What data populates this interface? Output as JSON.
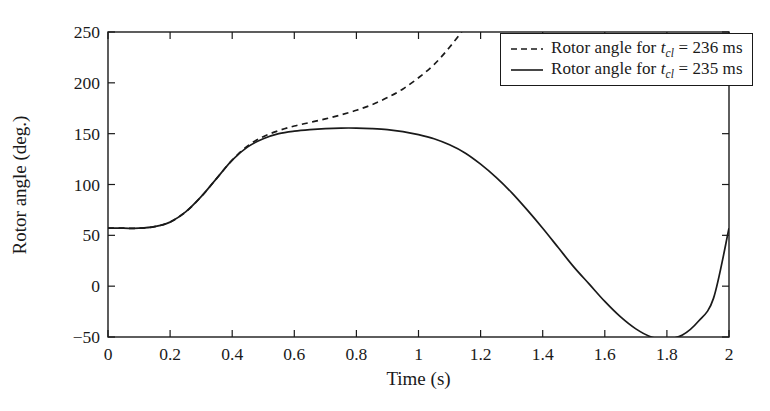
{
  "chart_data": {
    "type": "line",
    "title": "",
    "xlabel": "Time (s)",
    "ylabel": "Rotor angle (deg.)",
    "xlim": [
      0,
      2
    ],
    "ylim": [
      -50,
      250
    ],
    "xticks": [
      "0",
      "0.2",
      "0.4",
      "0.6",
      "0.8",
      "1",
      "1.2",
      "1.4",
      "1.6",
      "1.8",
      "2"
    ],
    "xtick_values": [
      0,
      0.2,
      0.4,
      0.6,
      0.8,
      1,
      1.2,
      1.4,
      1.6,
      1.8,
      2
    ],
    "yticks": [
      "250",
      "200",
      "150",
      "100",
      "50",
      "0",
      "−50"
    ],
    "ytick_values": [
      250,
      200,
      150,
      100,
      50,
      0,
      -50
    ],
    "grid": false,
    "legend_position": "top-right",
    "line_color": "#1a1a1a",
    "series": [
      {
        "name": "Rotor angle for t_cl = 236 ms",
        "label_prefix": "Rotor angle for ",
        "label_var": "t",
        "label_sub": "cl",
        "label_suffix": " = 236 ms",
        "style": "dashed",
        "x": [
          0,
          0.05,
          0.1,
          0.15,
          0.2,
          0.25,
          0.3,
          0.35,
          0.4,
          0.45,
          0.5,
          0.55,
          0.6,
          0.65,
          0.7,
          0.75,
          0.8,
          0.85,
          0.9,
          0.95,
          1.0,
          1.05,
          1.1,
          1.15,
          1.18,
          1.2
        ],
        "values": [
          57,
          57,
          57,
          58.5,
          63,
          73,
          88,
          106,
          124,
          138,
          147,
          153,
          157.5,
          161,
          164.5,
          168.5,
          173,
          178.5,
          185.5,
          194,
          205,
          218,
          235,
          255,
          270,
          285
        ]
      },
      {
        "name": "Rotor angle for t_cl = 235 ms",
        "label_prefix": "Rotor angle for ",
        "label_var": "t",
        "label_sub": "cl",
        "label_suffix": " = 235 ms",
        "style": "solid",
        "x": [
          0,
          0.05,
          0.1,
          0.15,
          0.2,
          0.25,
          0.3,
          0.35,
          0.4,
          0.45,
          0.5,
          0.55,
          0.6,
          0.65,
          0.7,
          0.75,
          0.8,
          0.85,
          0.9,
          0.95,
          1.0,
          1.05,
          1.1,
          1.15,
          1.2,
          1.25,
          1.3,
          1.35,
          1.4,
          1.45,
          1.5,
          1.55,
          1.6,
          1.65,
          1.7,
          1.75,
          1.8,
          1.85,
          1.9,
          1.95,
          2.0
        ],
        "values": [
          57,
          57,
          57,
          58.5,
          63,
          73,
          88,
          106,
          124,
          137,
          145,
          150,
          152.5,
          154,
          155,
          155.5,
          155.5,
          155,
          154,
          152,
          149,
          145,
          139,
          131,
          120,
          107,
          92,
          75,
          57,
          38,
          19,
          2,
          -15,
          -30,
          -42,
          -50,
          -52,
          -48,
          -35,
          -12,
          57
        ]
      }
    ],
    "annotations": {
      "initial_angle": 57,
      "solid_peak": {
        "x": 0.79,
        "y": 155.5
      },
      "solid_min": {
        "x": 1.79,
        "y": -52
      },
      "divergence_x": 0.52,
      "dashed_exit_x": 1.2
    }
  }
}
